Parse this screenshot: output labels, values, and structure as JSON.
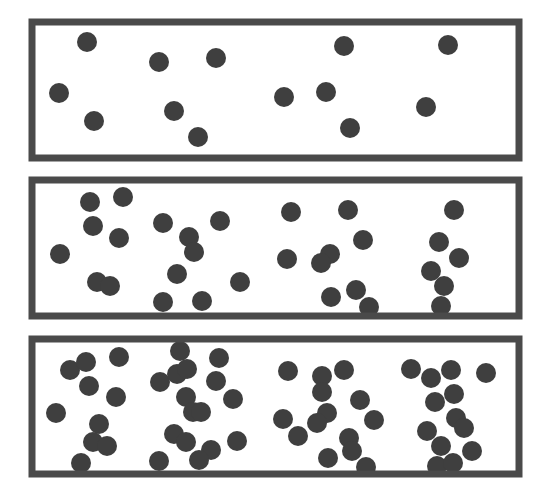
{
  "diagram": {
    "colors": {
      "border": "#4a4a4a",
      "particle": "#3f3f3f",
      "background": "#ffffff"
    },
    "particle_radius": 10,
    "containers": [
      {
        "name": "container-low-concentration",
        "x": 32,
        "y": 22,
        "width": 487,
        "height": 136,
        "particles": [
          [
            87,
            42
          ],
          [
            159,
            62
          ],
          [
            216,
            58
          ],
          [
            344,
            46
          ],
          [
            448,
            45
          ],
          [
            59,
            93
          ],
          [
            94,
            121
          ],
          [
            174,
            111
          ],
          [
            198,
            137
          ],
          [
            284,
            97
          ],
          [
            326,
            92
          ],
          [
            350,
            128
          ],
          [
            426,
            107
          ]
        ]
      },
      {
        "name": "container-medium-concentration",
        "x": 32,
        "y": 180,
        "width": 487,
        "height": 136,
        "particles": [
          [
            90,
            202
          ],
          [
            123,
            197
          ],
          [
            93,
            226
          ],
          [
            119,
            238
          ],
          [
            60,
            254
          ],
          [
            163,
            223
          ],
          [
            220,
            221
          ],
          [
            189,
            237
          ],
          [
            194,
            252
          ],
          [
            177,
            274
          ],
          [
            240,
            282
          ],
          [
            97,
            282
          ],
          [
            110,
            286
          ],
          [
            163,
            302
          ],
          [
            202,
            301
          ],
          [
            291,
            212
          ],
          [
            348,
            210
          ],
          [
            454,
            210
          ],
          [
            363,
            240
          ],
          [
            330,
            254
          ],
          [
            321,
            263
          ],
          [
            287,
            259
          ],
          [
            356,
            290
          ],
          [
            331,
            297
          ],
          [
            369,
            307
          ],
          [
            439,
            242
          ],
          [
            459,
            258
          ],
          [
            431,
            271
          ],
          [
            444,
            286
          ],
          [
            441,
            306
          ]
        ]
      },
      {
        "name": "container-high-concentration",
        "x": 32,
        "y": 339,
        "width": 487,
        "height": 135,
        "particles": [
          [
            70,
            370
          ],
          [
            86,
            362
          ],
          [
            119,
            357
          ],
          [
            89,
            386
          ],
          [
            116,
            397
          ],
          [
            56,
            413
          ],
          [
            99,
            424
          ],
          [
            93,
            442
          ],
          [
            107,
            446
          ],
          [
            81,
            463
          ],
          [
            180,
            351
          ],
          [
            160,
            382
          ],
          [
            177,
            374
          ],
          [
            187,
            369
          ],
          [
            219,
            358
          ],
          [
            216,
            381
          ],
          [
            186,
            397
          ],
          [
            193,
            412
          ],
          [
            201,
            412
          ],
          [
            233,
            399
          ],
          [
            174,
            434
          ],
          [
            186,
            442
          ],
          [
            211,
            450
          ],
          [
            199,
            460
          ],
          [
            237,
            441
          ],
          [
            159,
            461
          ],
          [
            288,
            371
          ],
          [
            322,
            376
          ],
          [
            322,
            392
          ],
          [
            344,
            370
          ],
          [
            360,
            400
          ],
          [
            374,
            420
          ],
          [
            327,
            413
          ],
          [
            317,
            423
          ],
          [
            283,
            419
          ],
          [
            298,
            436
          ],
          [
            349,
            438
          ],
          [
            352,
            451
          ],
          [
            328,
            458
          ],
          [
            366,
            467
          ],
          [
            411,
            369
          ],
          [
            431,
            378
          ],
          [
            451,
            370
          ],
          [
            486,
            373
          ],
          [
            435,
            402
          ],
          [
            454,
            394
          ],
          [
            456,
            418
          ],
          [
            464,
            428
          ],
          [
            427,
            431
          ],
          [
            441,
            446
          ],
          [
            472,
            451
          ],
          [
            437,
            466
          ],
          [
            453,
            463
          ]
        ]
      }
    ]
  }
}
